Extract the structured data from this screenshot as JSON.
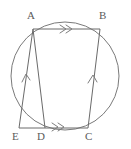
{
  "figure": {
    "canvas": {
      "width": 131,
      "height": 149,
      "background": "#ffffff"
    },
    "stroke_color": "#6f6f6f",
    "label_color": "#5b5b5b",
    "circle": {
      "cx": 65,
      "cy": 76,
      "r": 54
    },
    "points": [
      {
        "id": "A",
        "label": "A",
        "x": 33,
        "y": 29,
        "label_x": 27,
        "label_y": 10
      },
      {
        "id": "B",
        "label": "B",
        "x": 100,
        "y": 29,
        "label_x": 99,
        "label_y": 10
      },
      {
        "id": "C",
        "label": "C",
        "x": 88,
        "y": 128,
        "label_x": 85,
        "label_y": 131
      },
      {
        "id": "D",
        "label": "D",
        "x": 45,
        "y": 128,
        "label_x": 37,
        "label_y": 131
      },
      {
        "id": "E",
        "label": "E",
        "x": 19,
        "y": 128,
        "label_x": 12,
        "label_y": 131
      }
    ],
    "segments": [
      {
        "id": "AB",
        "from": "A",
        "to": "B",
        "marks": "double-chevron"
      },
      {
        "id": "DC",
        "from": "D",
        "to": "C",
        "marks": "double-chevron"
      },
      {
        "id": "AE",
        "from": "A",
        "to": "E",
        "marks": "single-chevron"
      },
      {
        "id": "CB",
        "from": "C",
        "to": "B",
        "marks": "single-chevron"
      },
      {
        "id": "AD",
        "from": "A",
        "to": "D",
        "marks": "none"
      },
      {
        "id": "ED",
        "from": "E",
        "to": "D",
        "marks": "none"
      }
    ],
    "marker_labels": {
      "double": "»",
      "single": "›"
    }
  }
}
